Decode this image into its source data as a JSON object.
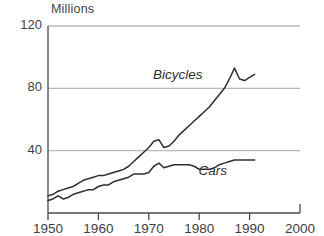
{
  "chart_data": {
    "type": "line",
    "title": "",
    "subtitle": "",
    "xlabel": "",
    "ylabel": "Millions",
    "unit_label": "Millions",
    "xlim": [
      1950,
      2000
    ],
    "ylim": [
      0,
      120
    ],
    "xticks": [
      1950,
      1960,
      1970,
      1980,
      1990,
      2000
    ],
    "xtick_labels": [
      "1950",
      "1960",
      "1970",
      "1980",
      "1990",
      "2000"
    ],
    "yticks": [
      0,
      40,
      80,
      120
    ],
    "ytick_labels": [
      "",
      "40",
      "80",
      "120"
    ],
    "grid": "horizontal",
    "gridlines_at": [
      40,
      80,
      120
    ],
    "legend_position": "inline-annotations",
    "legend_entries": [
      "Bicycles",
      "Cars"
    ],
    "annotations": [
      {
        "text": "Bicycles",
        "x": 1976,
        "y": 88,
        "style": "italic"
      },
      {
        "text": "Cars",
        "x": 1985,
        "y": 26,
        "style": "italic"
      }
    ],
    "series": [
      {
        "name": "Bicycles",
        "label": "Bicycles",
        "color": "#2e2e2e",
        "x": [
          1950,
          1951,
          1952,
          1953,
          1954,
          1955,
          1956,
          1957,
          1958,
          1959,
          1960,
          1961,
          1962,
          1963,
          1964,
          1965,
          1966,
          1967,
          1968,
          1969,
          1970,
          1971,
          1972,
          1973,
          1974,
          1975,
          1976,
          1977,
          1978,
          1979,
          1980,
          1981,
          1982,
          1983,
          1984,
          1985,
          1986,
          1987,
          1988,
          1989,
          1990,
          1991
        ],
        "values": [
          11,
          12,
          14,
          15,
          16,
          17,
          19,
          21,
          22,
          23,
          24,
          24,
          25,
          26,
          27,
          28,
          30,
          33,
          36,
          39,
          42,
          46,
          47,
          42,
          43,
          46,
          50,
          53,
          56,
          59,
          62,
          65,
          68,
          72,
          76,
          80,
          86,
          93,
          86,
          85,
          87,
          89
        ]
      },
      {
        "name": "Cars",
        "label": "Cars",
        "color": "#2e2e2e",
        "x": [
          1950,
          1951,
          1952,
          1953,
          1954,
          1955,
          1956,
          1957,
          1958,
          1959,
          1960,
          1961,
          1962,
          1963,
          1964,
          1965,
          1966,
          1967,
          1968,
          1969,
          1970,
          1971,
          1972,
          1973,
          1974,
          1975,
          1976,
          1977,
          1978,
          1979,
          1980,
          1981,
          1982,
          1983,
          1984,
          1985,
          1986,
          1987,
          1988,
          1989,
          1990,
          1991
        ],
        "values": [
          8,
          9,
          11,
          9,
          10,
          12,
          13,
          14,
          15,
          15,
          17,
          18,
          18,
          20,
          21,
          22,
          23,
          25,
          25,
          25,
          26,
          30,
          32,
          29,
          30,
          31,
          31,
          31,
          31,
          30,
          28,
          28,
          28,
          29,
          31,
          32,
          33,
          34,
          34,
          34,
          34,
          34
        ]
      }
    ]
  }
}
